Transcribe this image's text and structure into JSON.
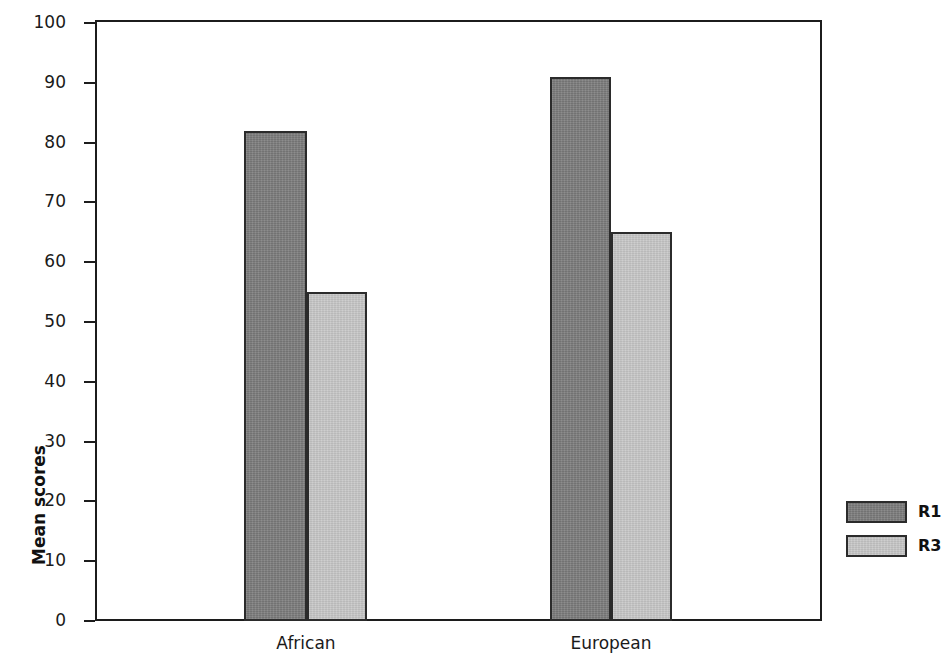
{
  "chart_data": {
    "type": "bar",
    "title": "",
    "subtitle": "",
    "xlabel": "",
    "ylabel": "Mean scores",
    "categories": [
      "African",
      "European"
    ],
    "series": [
      {
        "name": "R1",
        "color": "#808080",
        "values": [
          82,
          91
        ]
      },
      {
        "name": "R3",
        "color": "#c9c9c9",
        "values": [
          55,
          65
        ]
      }
    ],
    "ylim": [
      0,
      100
    ],
    "ytick_labels": [
      "100",
      "90",
      "80",
      "70",
      "60",
      "50",
      "40",
      "30",
      "20",
      "10",
      "0"
    ],
    "ytick_values": [
      100,
      90,
      80,
      70,
      60,
      50,
      40,
      30,
      20,
      10,
      0
    ],
    "grid": false,
    "legend_position": "right",
    "legend_entries": [
      "R1",
      "R3"
    ],
    "annotations": []
  },
  "axis": {
    "y_title": "Mean scores",
    "ticks": [
      {
        "label": "100",
        "value": 100
      },
      {
        "label": "90",
        "value": 90
      },
      {
        "label": "80",
        "value": 80
      },
      {
        "label": "70",
        "value": 70
      },
      {
        "label": "60",
        "value": 60
      },
      {
        "label": "50",
        "value": 50
      },
      {
        "label": "40",
        "value": 40
      },
      {
        "label": "30",
        "value": 30
      },
      {
        "label": "20",
        "value": 20
      },
      {
        "label": "10",
        "value": 10
      },
      {
        "label": "0",
        "value": 0
      }
    ]
  },
  "categories": [
    {
      "label": "African"
    },
    {
      "label": "European"
    }
  ],
  "legend": {
    "items": [
      {
        "label": "R1",
        "color": "#808080"
      },
      {
        "label": "R3",
        "color": "#c9c9c9"
      }
    ]
  },
  "colors": {
    "series_r1": "#808080",
    "series_r3": "#c9c9c9",
    "outline": "#2b2b2b",
    "axis": "#1c1c1c",
    "text": "#1a1a1a",
    "background": "#ffffff"
  }
}
